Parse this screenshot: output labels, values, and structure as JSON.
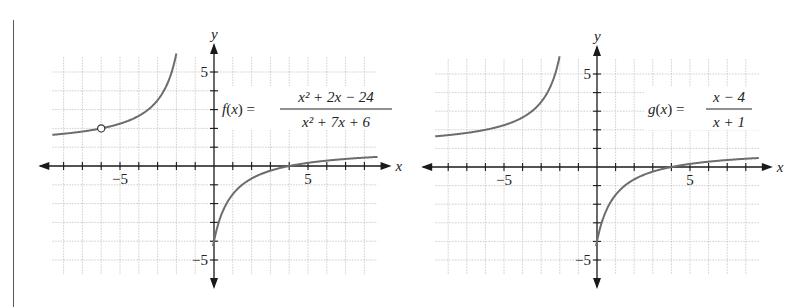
{
  "chart_data": [
    {
      "type": "line",
      "title": "",
      "function_label": "f(x) =",
      "numerator": "x² + 2x − 24",
      "denominator": "x² + 7x + 6",
      "expression": "(x^2 + 2x - 24)/(x^2 + 7x + 6)",
      "xlabel": "x",
      "ylabel": "y",
      "xlim": [
        -8.6,
        8.7
      ],
      "ylim": [
        -5.8,
        5.8
      ],
      "x_tick_labels": [
        {
          "value": -5,
          "label": "−5"
        },
        {
          "value": 5,
          "label": "5"
        }
      ],
      "y_tick_labels": [
        {
          "value": 5,
          "label": "5"
        },
        {
          "value": -5,
          "label": "−5"
        }
      ],
      "grid": true,
      "vertical_asymptote": -1,
      "horizontal_asymptote": 1,
      "x_intercept": 4,
      "hole": {
        "x": -6,
        "y": 2
      },
      "left_branch": {
        "x_from": -8.6,
        "x_to": -1.5
      },
      "right_branch": {
        "x_from": -0.05,
        "x_to": 8.7
      }
    },
    {
      "type": "line",
      "title": "",
      "function_label": "g(x) =",
      "numerator": "x − 4",
      "denominator": "x + 1",
      "expression": "(x - 4)/(x + 1)",
      "xlabel": "x",
      "ylabel": "y",
      "xlim": [
        -8.7,
        8.7
      ],
      "ylim": [
        -5.8,
        5.8
      ],
      "x_tick_labels": [
        {
          "value": -5,
          "label": "−5"
        },
        {
          "value": 5,
          "label": "5"
        }
      ],
      "y_tick_labels": [
        {
          "value": 5,
          "label": "5"
        },
        {
          "value": -5,
          "label": "−5"
        }
      ],
      "grid": true,
      "vertical_asymptote": -1,
      "horizontal_asymptote": 1,
      "x_intercept": 4,
      "hole": null,
      "left_branch": {
        "x_from": -8.7,
        "x_to": -1.5
      },
      "right_branch": {
        "x_from": -0.05,
        "x_to": 8.7
      }
    }
  ],
  "layout": {
    "plots": [
      {
        "origin_x": 214,
        "origin_y": 166,
        "unit": 18.8,
        "eq_x": 222,
        "eq_y": 108
      },
      {
        "origin_x": 597,
        "origin_y": 167,
        "unit": 18.6,
        "eq_x": 648,
        "eq_y": 108
      }
    ]
  }
}
